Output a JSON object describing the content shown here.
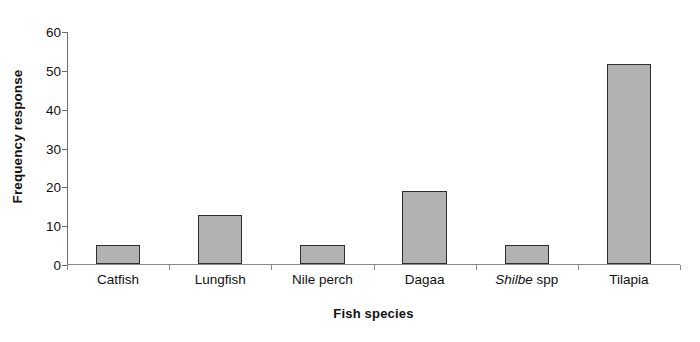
{
  "chart_data": {
    "type": "bar",
    "title": "",
    "xlabel": "Fish species",
    "ylabel": "Frequency response",
    "categories": [
      "Catfish",
      "Lungfish",
      "Nile perch",
      "Dagaa",
      "Shilbe spp",
      "Tilapia"
    ],
    "category_labels_html": [
      {
        "plain": "Catfish",
        "italic_part": "",
        "rest": ""
      },
      {
        "plain": "Lungfish",
        "italic_part": "",
        "rest": ""
      },
      {
        "plain": "Nile perch",
        "italic_part": "",
        "rest": ""
      },
      {
        "plain": "Dagaa",
        "italic_part": "",
        "rest": ""
      },
      {
        "plain": "",
        "italic_part": "Shilbe",
        "rest": " spp"
      },
      {
        "plain": "Tilapia",
        "italic_part": "",
        "rest": ""
      }
    ],
    "values": [
      5,
      12.7,
      5,
      18.8,
      5,
      51.5
    ],
    "ylim": [
      0,
      60
    ],
    "ytick_values": [
      0,
      10,
      20,
      30,
      40,
      50,
      60
    ],
    "ytick_labels": [
      "0",
      "10",
      "20",
      "30",
      "40",
      "50",
      "60"
    ],
    "grid": false,
    "legend": false,
    "bar_fill_color": "#b2b2b2",
    "bar_border_color": "#2e2e2e",
    "axis_color": "#6f6f6f",
    "background_color": "#ffffff"
  }
}
